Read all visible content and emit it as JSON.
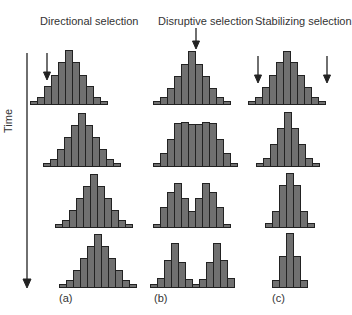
{
  "titles": {
    "a": "Directional selection",
    "b": "Disruptive selection",
    "c": "Stabilizing selection"
  },
  "axis": {
    "label": "Time",
    "direction": "down"
  },
  "sublabels": {
    "a": "(a)",
    "b": "(b)",
    "c": "(c)"
  },
  "colors": {
    "bar_fill": "#707070",
    "bar_stroke": "#222222",
    "arrow": "#222222"
  },
  "chart_data": {
    "type": "bar",
    "columns": [
      {
        "name": "Directional selection",
        "label": "(a)",
        "arrows": [
          "left tail"
        ],
        "rows": [
          {
            "x": 30,
            "values": [
              3,
              7,
              18,
              29,
              42,
              54,
              42,
              29,
              18,
              7,
              3
            ]
          },
          {
            "x": 43,
            "values": [
              3,
              7,
              17,
              29,
              41,
              53,
              41,
              29,
              17,
              7,
              3
            ]
          },
          {
            "x": 55,
            "values": [
              3,
              7,
              17,
              29,
              41,
              53,
              41,
              29,
              17,
              7,
              3
            ]
          },
          {
            "x": 59,
            "values": [
              3,
              7,
              17,
              29,
              41,
              53,
              41,
              29,
              17,
              7,
              3
            ]
          }
        ]
      },
      {
        "name": "Disruptive selection",
        "label": "(b)",
        "arrows": [
          "center"
        ],
        "rows": [
          {
            "x": 153,
            "values": [
              3,
              7,
              16,
              28,
              40,
              53,
              40,
              28,
              16,
              7,
              3
            ]
          },
          {
            "x": 153,
            "values": [
              3,
              13,
              27,
              43,
              44,
              42,
              42,
              44,
              43,
              27,
              13,
              3
            ]
          },
          {
            "x": 153,
            "values": [
              3,
              20,
              35,
              44,
              29,
              16,
              29,
              44,
              35,
              20,
              3
            ]
          },
          {
            "x": 150,
            "values": [
              3,
              9,
              27,
              44,
              25,
              8,
              3,
              8,
              25,
              44,
              27,
              9
            ]
          }
        ]
      },
      {
        "name": "Stabilizing selection",
        "label": "(c)",
        "arrows": [
          "left tail",
          "right tail"
        ],
        "rows": [
          {
            "x": 248,
            "values": [
              3,
              7,
              17,
              29,
              42,
              53,
              42,
              29,
              17,
              7,
              3
            ]
          },
          {
            "x": 256,
            "values": [
              3,
              8,
              22,
              38,
              54,
              38,
              22,
              8,
              3
            ]
          },
          {
            "x": 265,
            "values": [
              4,
              16,
              42,
              54,
              42,
              16,
              4
            ]
          },
          {
            "x": 272,
            "values": [
              7,
              31,
              54,
              31,
              7
            ]
          }
        ]
      }
    ],
    "row_baselines": [
      104,
      166,
      227,
      287
    ]
  }
}
